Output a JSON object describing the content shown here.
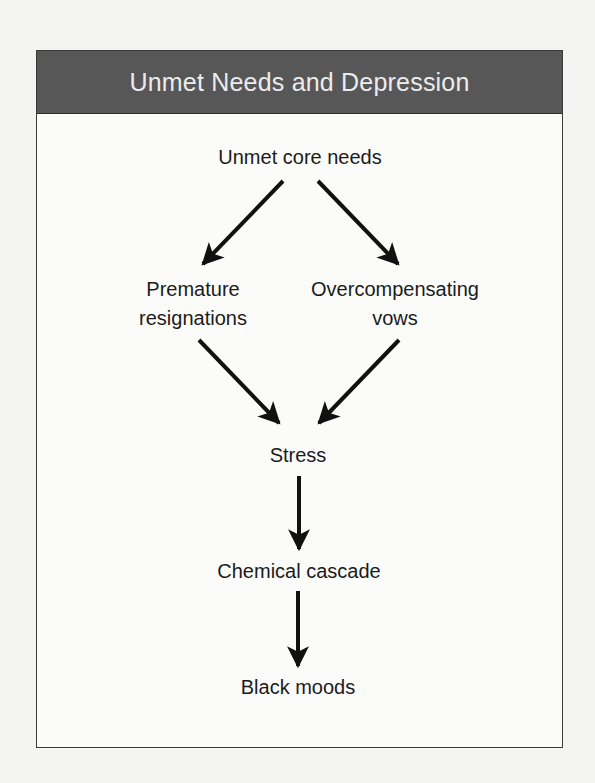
{
  "title": "Unmet Needs and Depression",
  "nodes": {
    "root": "Unmet core needs",
    "left_line1": "Premature",
    "left_line2": "resignations",
    "right_line1": "Overcompensating",
    "right_line2": "vows",
    "stress": "Stress",
    "cascade": "Chemical cascade",
    "moods": "Black moods"
  },
  "edges": [
    {
      "from": "Unmet core needs",
      "to": "Premature resignations"
    },
    {
      "from": "Unmet core needs",
      "to": "Overcompensating vows"
    },
    {
      "from": "Premature resignations",
      "to": "Stress"
    },
    {
      "from": "Overcompensating vows",
      "to": "Stress"
    },
    {
      "from": "Stress",
      "to": "Chemical cascade"
    },
    {
      "from": "Chemical cascade",
      "to": "Black moods"
    }
  ],
  "colors": {
    "header_bg": "#575757",
    "header_text": "#ececec",
    "arrow": "#111111"
  }
}
